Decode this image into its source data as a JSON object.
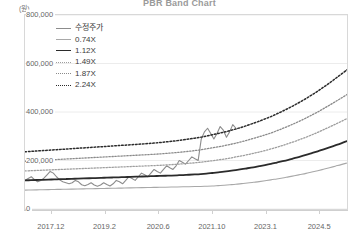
{
  "chart": {
    "title": "PBR Band Chart",
    "unit_label": "(원)"
  },
  "legend": {
    "items": [
      {
        "label": "수정주가",
        "style": "solid",
        "color": "#8c8c8c",
        "width": 1.1
      },
      {
        "label": "0.74X",
        "style": "solid",
        "color": "#a8a8a8",
        "width": 1.1
      },
      {
        "label": "1.12X",
        "style": "solid",
        "color": "#2b2b2b",
        "width": 1.8
      },
      {
        "label": "1.49X",
        "style": "dotted",
        "color": "#9e9e9e",
        "width": 1.3
      },
      {
        "label": "1.87X",
        "style": "dotted",
        "color": "#8a8a8a",
        "width": 1.3
      },
      {
        "label": "2.24X",
        "style": "dotted",
        "color": "#2b2b2b",
        "width": 1.5
      }
    ]
  },
  "chart_data": {
    "type": "line",
    "title": "PBR Band Chart",
    "xlabel": "",
    "ylabel": "(원)",
    "ylim": [
      0,
      800000
    ],
    "yticks": [
      0,
      200000,
      400000,
      600000,
      800000
    ],
    "ytick_labels": [
      "0",
      "200,000",
      "400,000",
      "600,000",
      "800,000"
    ],
    "xticks": [
      "2017.12",
      "2019.2",
      "2020.6",
      "2021.10",
      "2023.1",
      "2024.5"
    ],
    "xlim": [
      "2017.06",
      "2024.12"
    ],
    "grid": true,
    "legend_position": "top-left",
    "series": [
      {
        "name": "수정주가",
        "style": "solid",
        "color": "#8c8c8c",
        "values": [
          118000,
          126000,
          133000,
          121000,
          112000,
          118000,
          127000,
          141000,
          155000,
          148000,
          133000,
          120000,
          112000,
          108000,
          104000,
          108000,
          118000,
          112000,
          100000,
          96000,
          101000,
          108000,
          99000,
          94000,
          99000,
          108000,
          101000,
          95000,
          104000,
          118000,
          112000,
          104000,
          118000,
          133000,
          126000,
          118000,
          133000,
          148000,
          141000,
          133000,
          148000,
          163000,
          155000,
          148000,
          163000,
          178000,
          170000,
          163000,
          178000,
          200000,
          193000,
          185000,
          200000,
          215000,
          207000,
          200000,
          289000,
          318000,
          333000,
          311000,
          289000,
          311000,
          340000,
          325000,
          296000,
          318000,
          348000,
          333000
        ]
      },
      {
        "name": "0.74X",
        "style": "solid",
        "color": "#a8a8a8",
        "values": [
          78000,
          78500,
          79000,
          79500,
          80000,
          80500,
          81000,
          81500,
          82000,
          82500,
          83000,
          83500,
          84000,
          84500,
          85000,
          85500,
          86000,
          86500,
          87000,
          87500,
          88000,
          88500,
          89000,
          89500,
          90000,
          90500,
          91000,
          91500,
          92000,
          92500,
          93000,
          94000,
          95000,
          96500,
          98000,
          100000,
          102000,
          104500,
          107000,
          110000,
          113000,
          116500,
          120000,
          124000,
          128000,
          132500,
          137000,
          142000,
          147000,
          152500,
          158000,
          164000,
          170000,
          176500,
          183000,
          190000
        ]
      },
      {
        "name": "1.12X",
        "style": "solid",
        "color": "#2b2b2b",
        "values": [
          118000,
          118800,
          119600,
          120400,
          121200,
          122000,
          122800,
          123600,
          124400,
          125200,
          126000,
          126800,
          127600,
          128400,
          129200,
          130000,
          130800,
          131600,
          132400,
          133200,
          134000,
          134800,
          135600,
          136400,
          137200,
          138000,
          139000,
          140000,
          141200,
          142500,
          144000,
          146000,
          148500,
          151000,
          154000,
          157000,
          160500,
          164000,
          168000,
          172000,
          176500,
          181000,
          186000,
          191500,
          197000,
          203000,
          209500,
          216000,
          223000,
          230500,
          238000,
          246000,
          254000,
          262500,
          271000,
          280000
        ]
      },
      {
        "name": "1.49X",
        "style": "dotted",
        "color": "#9e9e9e",
        "values": [
          157000,
          158000,
          159000,
          160000,
          161000,
          162000,
          163000,
          164000,
          165000,
          166000,
          167000,
          168000,
          169000,
          170000,
          171000,
          172000,
          173000,
          174000,
          175000,
          176000,
          177000,
          178000,
          179000,
          180000,
          181500,
          183000,
          184500,
          186500,
          188500,
          190500,
          193000,
          196000,
          199000,
          202500,
          206000,
          210000,
          214500,
          219000,
          224000,
          229500,
          235000,
          241000,
          247500,
          254500,
          262000,
          270000,
          278000,
          287000,
          296000,
          306000,
          316000,
          327000,
          338000,
          349500,
          361000,
          373000
        ]
      },
      {
        "name": "1.87X",
        "style": "dotted",
        "color": "#8a8a8a",
        "values": [
          197000,
          198300,
          199600,
          200900,
          202200,
          203500,
          204800,
          206100,
          207400,
          208700,
          210000,
          211300,
          212600,
          213900,
          215200,
          216500,
          217800,
          219100,
          220400,
          221700,
          223000,
          224300,
          225600,
          227200,
          229000,
          231000,
          233000,
          235500,
          238000,
          241000,
          244000,
          248000,
          252000,
          256500,
          261000,
          266000,
          271500,
          277500,
          284000,
          291000,
          298000,
          305500,
          313500,
          322500,
          332000,
          342000,
          352500,
          363500,
          375000,
          387500,
          400000,
          414000,
          428000,
          442500,
          457000,
          472000
        ]
      },
      {
        "name": "2.24X",
        "style": "dotted",
        "color": "#2b2b2b",
        "values": [
          236000,
          237600,
          239200,
          240800,
          242400,
          244000,
          245600,
          247200,
          248800,
          250400,
          252000,
          253600,
          255200,
          256800,
          258400,
          260000,
          261600,
          263200,
          264800,
          266400,
          268000,
          269800,
          271800,
          274000,
          276500,
          279000,
          282000,
          285000,
          288500,
          292000,
          296000,
          301000,
          306000,
          311500,
          317000,
          323000,
          330000,
          337000,
          345000,
          353500,
          362000,
          371500,
          381000,
          392000,
          403500,
          415500,
          428000,
          441500,
          455500,
          470500,
          486000,
          502500,
          519500,
          537500,
          555500,
          574000
        ]
      }
    ]
  }
}
